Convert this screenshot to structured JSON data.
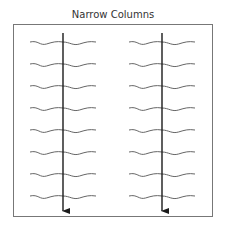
{
  "figure": {
    "title": "Narrow Columns"
  },
  "diagram": {
    "frame": {
      "x": 13,
      "y": 24,
      "width": 200,
      "height": 193,
      "stroke": "#777777"
    },
    "text_line_color": "#666666",
    "arrow_color": "#1a1a1a",
    "columns": [
      {
        "name": "left-column",
        "center_x": 63,
        "left_x": 30,
        "right_x": 96
      },
      {
        "name": "right-column",
        "center_x": 162,
        "left_x": 129,
        "right_x": 195
      }
    ],
    "rows_y": [
      43,
      65,
      87,
      109,
      131,
      153,
      175,
      197
    ],
    "arrow": {
      "top_y": 33,
      "bottom_y": 211
    }
  }
}
